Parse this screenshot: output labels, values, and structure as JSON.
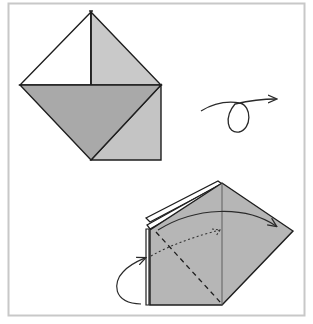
{
  "figure": {
    "type": "origami-instruction-diagram",
    "frame_color": "#c8c8c8",
    "colors": {
      "paper_white": "#ffffff",
      "paper_light": "#c4c4c4",
      "paper_mid": "#a9a9a9",
      "paper_back": "#b6b6b6",
      "line": "#1e1e1e"
    },
    "steps": [
      {
        "name": "step-1-shape",
        "description": "Square base folded with two upper triangles and lower flap"
      },
      {
        "name": "turn-over-symbol",
        "description": "Looped arrow indicating turn model over"
      },
      {
        "name": "step-2-shape",
        "description": "Turned model with valley fold dashed line and fold arrows"
      }
    ]
  }
}
